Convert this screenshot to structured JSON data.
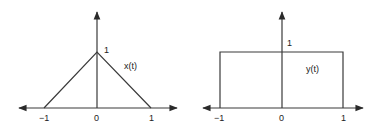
{
  "colors": {
    "line": "#3a3a3a",
    "text": "#222222",
    "background": "#ffffff"
  },
  "plots": [
    {
      "id": "x",
      "signal_label": "x(t)",
      "shape": "triangle",
      "peak_label": "1",
      "ticks": [
        "−1",
        "0",
        "1"
      ],
      "points": [
        [
          -1,
          0
        ],
        [
          0,
          1
        ],
        [
          1,
          0
        ]
      ]
    },
    {
      "id": "y",
      "signal_label": "y(t)",
      "shape": "rectangle",
      "peak_label": "1",
      "ticks": [
        "−1",
        "0",
        "1"
      ],
      "points": [
        [
          -1,
          0
        ],
        [
          -1,
          1
        ],
        [
          1,
          1
        ],
        [
          1,
          0
        ]
      ]
    }
  ]
}
